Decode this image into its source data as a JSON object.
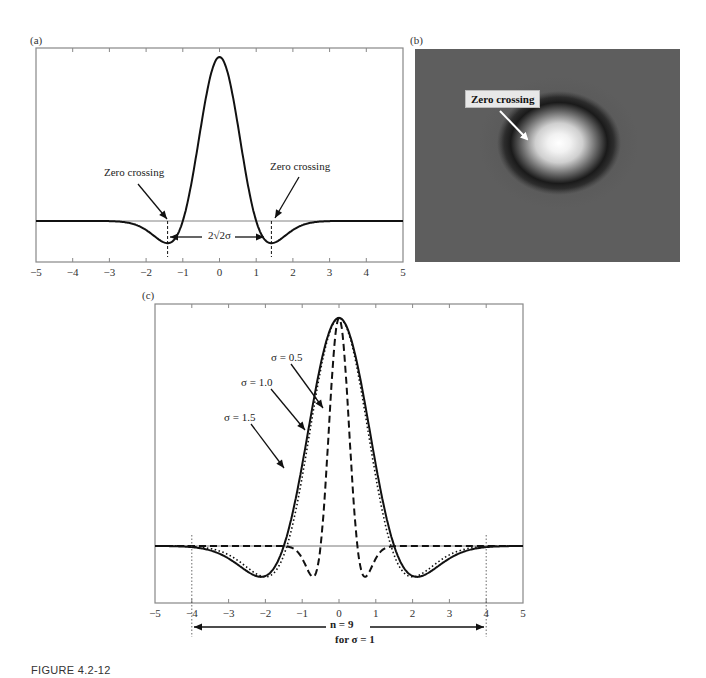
{
  "figure": {
    "caption": "FIGURE 4.2-12",
    "panels": {
      "a": {
        "label": "(a)",
        "annotations": {
          "zero_crossing_left": "Zero crossing",
          "zero_crossing_right": "Zero crossing",
          "width_label": "2√2σ"
        },
        "x_ticks": [
          "−5",
          "−4",
          "−3",
          "−2",
          "−1",
          "0",
          "1",
          "2",
          "3",
          "4",
          "5"
        ]
      },
      "b": {
        "label": "(b)",
        "annotation": "Zero crossing"
      },
      "c": {
        "label": "(c)",
        "legend": {
          "s05": "σ = 0.5",
          "s10": "σ = 1.0",
          "s15": "σ = 1.5"
        },
        "x_ticks": [
          "−5",
          "−4",
          "−3",
          "−2",
          "−1",
          "0",
          "1",
          "2",
          "3",
          "4",
          "5"
        ],
        "span_label": "n = 9",
        "span_sublabel": "for σ = 1"
      }
    }
  },
  "chart_data": [
    {
      "type": "line",
      "panel": "(a)",
      "title": "",
      "xlabel": "",
      "ylabel": "",
      "xlim": [
        -5,
        5
      ],
      "x_ticks": [
        -5,
        -4,
        -3,
        -2,
        -1,
        0,
        1,
        2,
        3,
        4,
        5
      ],
      "grid": false,
      "series": [
        {
          "name": "Laplacian of Gaussian (Mexican hat)",
          "style": "solid",
          "x": [
            -5,
            -4,
            -3,
            -2.5,
            -2,
            -1.5,
            -1.414,
            -1,
            -0.5,
            0,
            0.5,
            1,
            1.414,
            1.5,
            2,
            2.5,
            3,
            4,
            5
          ],
          "y": [
            0.0,
            -0.002,
            -0.039,
            -0.095,
            -0.135,
            -0.041,
            0.0,
            0.303,
            0.774,
            1.0,
            0.774,
            0.303,
            0.0,
            -0.041,
            -0.135,
            -0.095,
            -0.039,
            -0.002,
            0.0
          ]
        }
      ],
      "annotations": [
        {
          "text": "Zero crossing",
          "x": -1.414,
          "y": 0
        },
        {
          "text": "Zero crossing",
          "x": 1.414,
          "y": 0
        },
        {
          "text": "2√2σ",
          "span": [
            -1.414,
            1.414
          ]
        }
      ]
    },
    {
      "type": "line",
      "panel": "(c)",
      "title": "",
      "xlabel": "",
      "ylabel": "",
      "xlim": [
        -5,
        5
      ],
      "x_ticks": [
        -5,
        -4,
        -3,
        -2,
        -1,
        0,
        1,
        2,
        3,
        4,
        5
      ],
      "grid": false,
      "series": [
        {
          "name": "σ = 0.5",
          "style": "dashed",
          "x": [
            -5,
            -2,
            -1.5,
            -1,
            -0.707,
            -0.5,
            0,
            0.5,
            0.707,
            1,
            1.5,
            2,
            5
          ],
          "y": [
            0.0,
            -0.005,
            -0.041,
            -0.135,
            0.0,
            0.303,
            1.0,
            0.303,
            0.0,
            -0.135,
            -0.041,
            -0.005,
            0.0
          ]
        },
        {
          "name": "σ = 1.0",
          "style": "dotted",
          "x": [
            -5,
            -4,
            -3,
            -2,
            -1.414,
            -1,
            0,
            1,
            1.414,
            2,
            3,
            4,
            5
          ],
          "y": [
            -0.003,
            -0.017,
            -0.078,
            -0.135,
            0.0,
            0.303,
            1.0,
            0.303,
            0.0,
            -0.135,
            -0.078,
            -0.017,
            -0.003
          ],
          "comment": "normalized peak 1; min at ±2σ"
        },
        {
          "name": "σ = 1.5",
          "style": "solid",
          "x": [
            -5,
            -4,
            -3,
            -2.12,
            -1.5,
            0,
            1.5,
            2.12,
            3,
            4,
            5
          ],
          "y": [
            -0.055,
            -0.11,
            -0.135,
            0.0,
            0.303,
            1.0,
            0.303,
            0.0,
            -0.135,
            -0.11,
            -0.055
          ]
        }
      ],
      "annotations": [
        {
          "text": "n = 9",
          "span": [
            -4,
            4
          ]
        },
        {
          "text": "for σ = 1"
        }
      ]
    }
  ]
}
